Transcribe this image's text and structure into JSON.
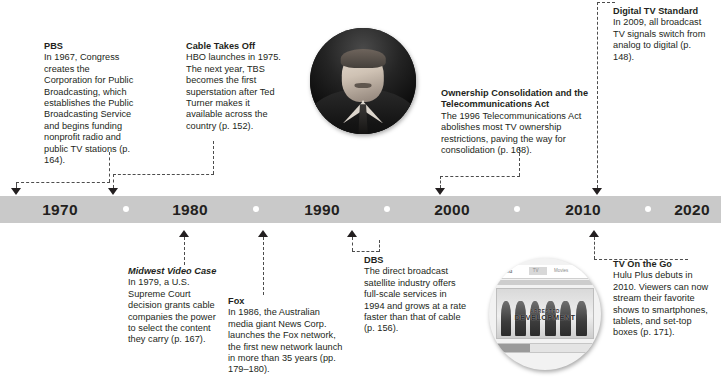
{
  "timeline": {
    "decades": [
      {
        "label": "1970",
        "x": 60
      },
      {
        "label": "1980",
        "x": 190
      },
      {
        "label": "1990",
        "x": 322
      },
      {
        "label": "2000",
        "x": 452
      },
      {
        "label": "2010",
        "x": 583
      },
      {
        "label": "2020",
        "x": 692
      }
    ],
    "separator_dots_x": [
      126,
      256,
      387,
      517,
      648
    ],
    "bar_color": "#c9c9c9",
    "dot_color": "#ffffff",
    "connector_color": "#4d4d4d",
    "arrow_color": "#231f20"
  },
  "events": {
    "pbs": {
      "title": "PBS",
      "body": "In 1967, Congress creates the Corporation for Public Broadcasting, which establishes the Public Broadcasting Service and begins funding nonprofit radio and public TV stations (p. 164)."
    },
    "cable": {
      "title": "Cable Takes Off",
      "body": "HBO launches in 1975. The next year, TBS becomes the first superstation after Ted Turner makes it available across the country (p. 152)."
    },
    "ownership": {
      "title": "Ownership Consolidation and the Telecommunications Act",
      "body": "The 1996 Telecommunications Act abolishes most TV ownership restrictions, paving the way for consolidation (p. 168)."
    },
    "digital": {
      "title": "Digital TV Standard",
      "body": "In 2009, all broadcast TV signals switch from analog to digital (p. 148)."
    },
    "midwest": {
      "title": "Midwest Video Case",
      "body": "In 1979, a U.S. Supreme Court decision grants cable companies the power to select the content they carry (p. 167)."
    },
    "fox": {
      "title": "Fox",
      "body": "In 1986, the Australian media giant News Corp. launches the Fox network, the first new network launch in more than 35 years (pp. 179–180)."
    },
    "dbs": {
      "title": "DBS",
      "body": "The direct broadcast satellite industry offers full-scale services in 1994 and grows at a rate faster than that of cable (p. 156)."
    },
    "tvonthego": {
      "title": "TV On the Go",
      "body": "Hulu Plus debuts in 2010. Viewers can now stream their favorite shows to smartphones, tablets, and set-top boxes (p. 171)."
    }
  },
  "images": {
    "portrait": {
      "caption": "ted-turner-portrait"
    },
    "hulu": {
      "caption": "hulu-plus-screenshot",
      "logo": "hulu",
      "nav_items": [
        "TV",
        "Movies"
      ],
      "show_title_top": "ARRESTED",
      "show_title_main": "DEVELOPMENT",
      "footer_left": "Help",
      "footer_right": "Share"
    }
  }
}
